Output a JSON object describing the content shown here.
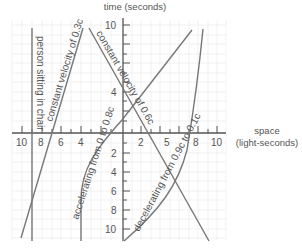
{
  "diagram": {
    "type": "spacetime-diagram",
    "y_axis": {
      "title": "time (seconds)",
      "top_labels": [
        "10",
        "4"
      ],
      "bottom_labels": [
        "2",
        "4",
        "6",
        "8",
        "10"
      ]
    },
    "x_axis": {
      "title_line1": "space",
      "title_line2": "(light-seconds)",
      "left_labels": [
        "10",
        "8",
        "6",
        "4"
      ],
      "right_labels": [
        "2",
        "5",
        "8",
        "10"
      ]
    },
    "worldlines": [
      {
        "label": "person sitting in chair"
      },
      {
        "label": "constant velocity of 0.3c"
      },
      {
        "label": "constant velocity of 0.6c"
      },
      {
        "label": "accelerating from 0 to 0.8c"
      },
      {
        "label": "decelerating from 0.9c to 0.1c"
      }
    ],
    "colors": {
      "line": "#777777",
      "axis": "#555555",
      "grid": "#eeeeee",
      "text": "#555555"
    }
  }
}
